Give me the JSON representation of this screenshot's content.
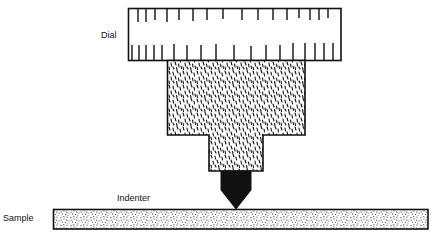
{
  "diagram": {
    "title": "",
    "labels": {
      "dial": "Dial",
      "indenter": "Indenter",
      "sample": "Sample"
    },
    "colors": {
      "ink": "#111111",
      "background": "#ffffff"
    },
    "dial": {
      "top_tick_count": 15,
      "bottom_tick_count": 17
    }
  }
}
